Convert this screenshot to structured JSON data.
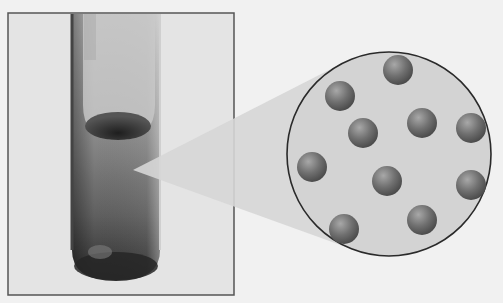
{
  "figure": {
    "background_color": "#f1f1f1",
    "photo_frame": {
      "x": 8,
      "y": 13,
      "width": 226,
      "height": 282,
      "border_color": "#555555",
      "fill": "#e4e4e4"
    },
    "test_tube": {
      "x": 70,
      "top": 13,
      "width": 92,
      "bottom": 280,
      "liquid_color": "#6e6e6e",
      "bottom_color": "#2e2e2e"
    },
    "magnifier_cone": {
      "apex_x": 133,
      "apex_y": 170,
      "fill": "#d6d6d6"
    },
    "magnified_view": {
      "cx": 389,
      "cy": 154,
      "r": 102,
      "fill": "#d3d3d3",
      "stroke": "#2a2a2a"
    },
    "particles": [
      {
        "cx": 398,
        "cy": 70,
        "r": 15
      },
      {
        "cx": 340,
        "cy": 96,
        "r": 15
      },
      {
        "cx": 363,
        "cy": 133,
        "r": 15
      },
      {
        "cx": 422,
        "cy": 123,
        "r": 15
      },
      {
        "cx": 471,
        "cy": 128,
        "r": 15
      },
      {
        "cx": 312,
        "cy": 167,
        "r": 15
      },
      {
        "cx": 387,
        "cy": 181,
        "r": 15
      },
      {
        "cx": 471,
        "cy": 185,
        "r": 15
      },
      {
        "cx": 344,
        "cy": 229,
        "r": 15
      },
      {
        "cx": 422,
        "cy": 220,
        "r": 15
      }
    ],
    "particle_color": "#707070",
    "particle_highlight": "#a8a8a8",
    "particle_shadow": "#4a4a4a"
  }
}
